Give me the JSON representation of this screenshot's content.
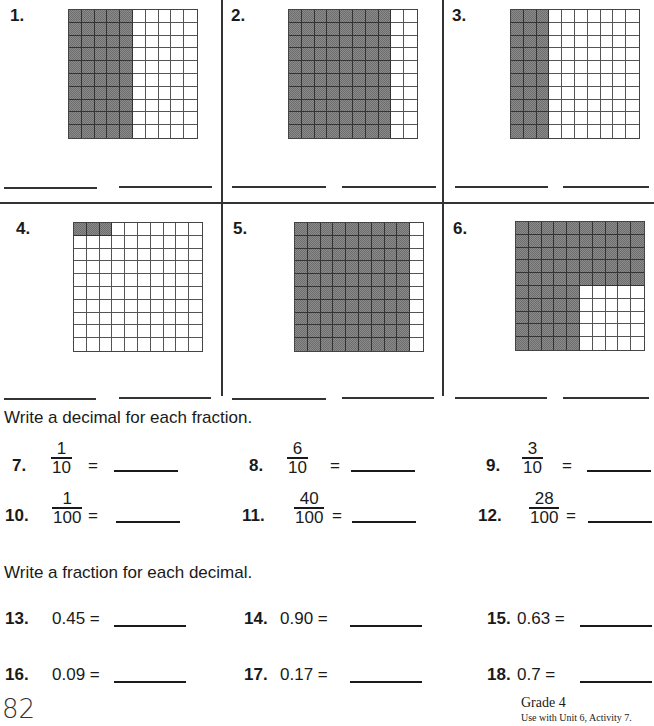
{
  "grid_problems": [
    {
      "number": "1.",
      "shaded_squares": 50,
      "pattern": "columns",
      "shaded_columns": 5
    },
    {
      "number": "2.",
      "shaded_squares": 80,
      "pattern": "columns",
      "shaded_columns": 8
    },
    {
      "number": "3.",
      "shaded_squares": 30,
      "pattern": "columns",
      "shaded_columns": 3
    },
    {
      "number": "4.",
      "shaded_squares": 3,
      "pattern": "top-row-cells",
      "shaded_cells": 3
    },
    {
      "number": "5.",
      "shaded_squares": 90,
      "pattern": "columns",
      "shaded_columns": 9
    },
    {
      "number": "6.",
      "shaded_squares": 75,
      "pattern": "L-shape",
      "full_rows": 5,
      "partial_row_columns": 5
    }
  ],
  "section_decimal": {
    "instruction": "Write a decimal for each fraction.",
    "items": [
      {
        "number": "7.",
        "numerator": "1",
        "denominator": "10",
        "equals": "="
      },
      {
        "number": "8.",
        "numerator": "6",
        "denominator": "10",
        "equals": "="
      },
      {
        "number": "9.",
        "numerator": "3",
        "denominator": "10",
        "equals": "="
      },
      {
        "number": "10.",
        "numerator": "1",
        "denominator": "100",
        "equals": "="
      },
      {
        "number": "11.",
        "numerator": "40",
        "denominator": "100",
        "equals": "="
      },
      {
        "number": "12.",
        "numerator": "28",
        "denominator": "100",
        "equals": "="
      }
    ]
  },
  "section_fraction": {
    "instruction": "Write a fraction for each decimal.",
    "items": [
      {
        "number": "13.",
        "decimal": "0.45 ="
      },
      {
        "number": "14.",
        "decimal": "0.90 ="
      },
      {
        "number": "15.",
        "decimal": "0.63 ="
      },
      {
        "number": "16.",
        "decimal": "0.09 ="
      },
      {
        "number": "17.",
        "decimal": "0.17 ="
      },
      {
        "number": "18.",
        "decimal": "0.7 ="
      }
    ]
  },
  "footer": {
    "page_number": "82",
    "grade": "Grade 4",
    "note": "Use with Unit 6, Activity 7."
  },
  "colors": {
    "shade": "#8a8a8a",
    "ink": "#1a1a1a"
  }
}
